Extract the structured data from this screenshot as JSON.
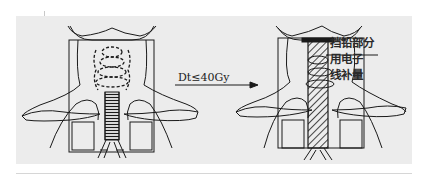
{
  "figure": {
    "left_panel": {
      "description": "neck anterior field before shielding, spinal cord visible with dashed vertebrae"
    },
    "arrow": {
      "label": "Dt≤40Gy"
    },
    "right_panel": {
      "description": "neck anterior field with spinal cord shielded (hatched block)",
      "annotation": {
        "lines": [
          "挡铅部分",
          "用电子",
          "线补量"
        ]
      }
    },
    "colors": {
      "background": "#ececec",
      "line": "#1a1a1a",
      "page": "#ffffff"
    }
  }
}
